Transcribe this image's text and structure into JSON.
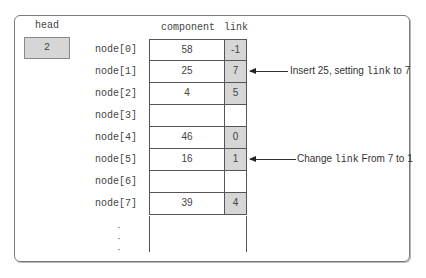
{
  "head": {
    "label": "head",
    "value": "2"
  },
  "columns": {
    "component": "component",
    "link": "link"
  },
  "rows": [
    {
      "label": "node[0]",
      "component": "58",
      "link": "-1",
      "filled": true
    },
    {
      "label": "node[1]",
      "component": "25",
      "link": "7",
      "filled": true
    },
    {
      "label": "node[2]",
      "component": "4",
      "link": "5",
      "filled": true
    },
    {
      "label": "node[3]",
      "component": "",
      "link": "",
      "filled": false
    },
    {
      "label": "node[4]",
      "component": "46",
      "link": "0",
      "filled": true
    },
    {
      "label": "node[5]",
      "component": "16",
      "link": "1",
      "filled": true
    },
    {
      "label": "node[6]",
      "component": "",
      "link": "",
      "filled": false
    },
    {
      "label": "node[7]",
      "component": "39",
      "link": "4",
      "filled": true
    }
  ],
  "ellipsis": ".\n.\n.",
  "annotations": [
    {
      "row": 1,
      "pre": "Insert 25, setting ",
      "code": "link",
      "post": " to 7"
    },
    {
      "row": 5,
      "pre": "Change ",
      "code": "link",
      "post": " From 7 to 1"
    }
  ],
  "colors": {
    "filled": "#d6d6d6",
    "border": "#555555",
    "frame": "#7a7a7a"
  }
}
